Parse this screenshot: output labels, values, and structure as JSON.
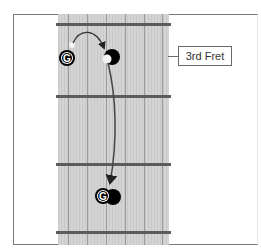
{
  "diagram": {
    "type": "guitar-fretboard",
    "fret_label": "3rd Fret",
    "note_start": {
      "label": "G",
      "style": "open-circle"
    },
    "note_end": {
      "label": "G",
      "style": "open-circle"
    },
    "target_marker": {
      "style": "filled-black-dot"
    },
    "strings_count": 6,
    "frets_visible": 4,
    "colors": {
      "neck": "#d4d4d4",
      "fret": "#5c5c5c",
      "marker": "#000000",
      "frame": "#7a7a7a"
    }
  }
}
